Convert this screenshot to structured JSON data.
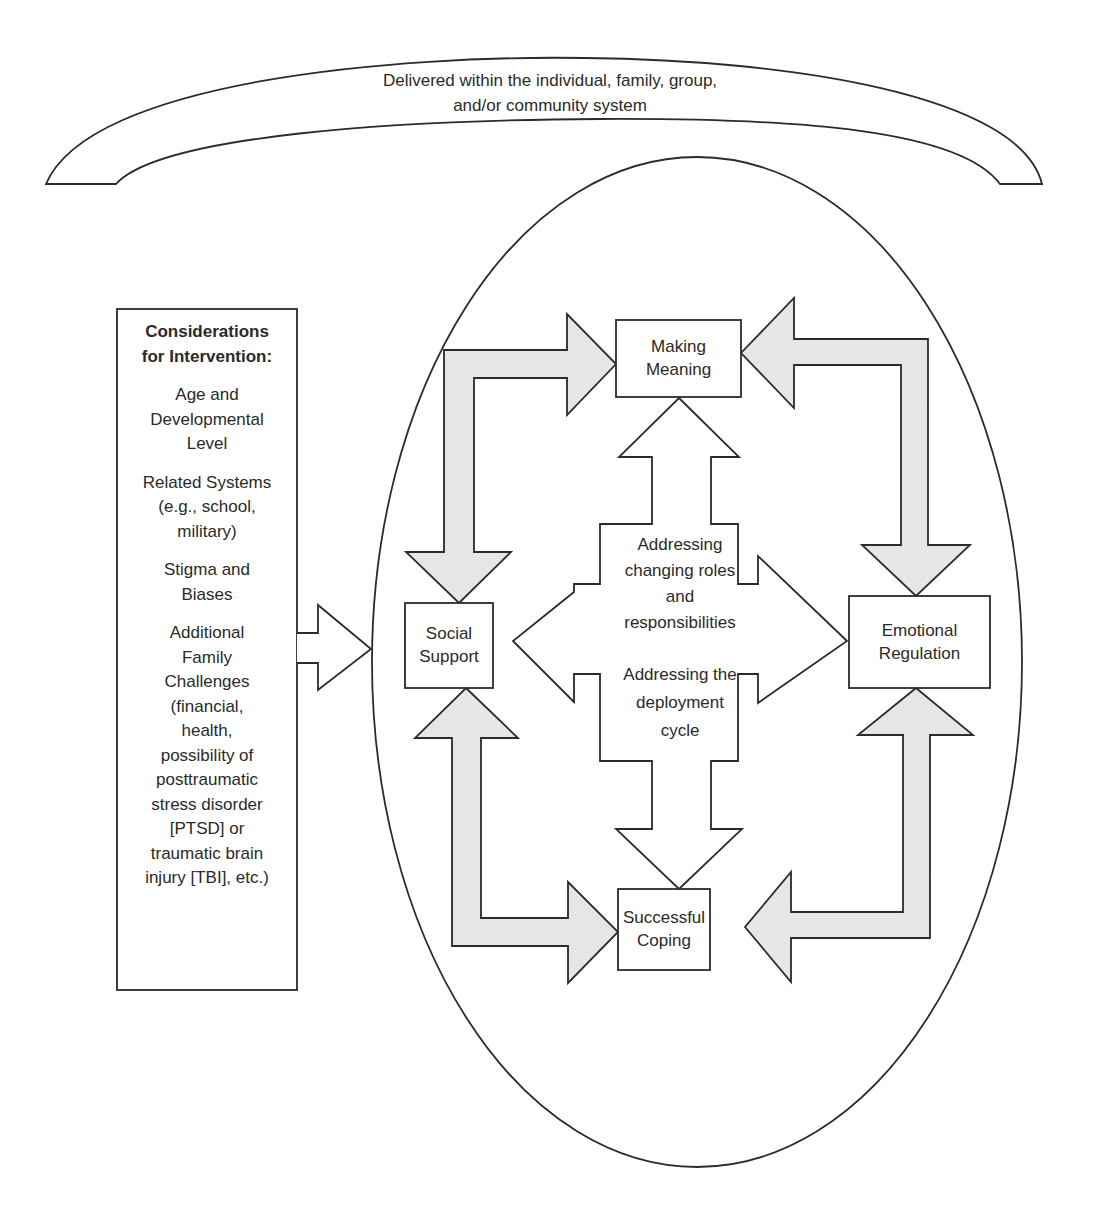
{
  "arc": {
    "lines": [
      "Delivered within the individual, family, group,",
      "and/or community system"
    ]
  },
  "considerations": {
    "title_lines": [
      "Considerations",
      "for Intervention:"
    ],
    "items": [
      {
        "lines": [
          "Age and",
          "Developmental",
          "Level"
        ]
      },
      {
        "lines": [
          "Related Systems",
          "(e.g., school,",
          "military)"
        ]
      },
      {
        "lines": [
          "Stigma and",
          "Biases"
        ]
      },
      {
        "lines": [
          "Additional",
          "Family",
          "Challenges",
          "(financial,",
          "health,",
          "possibility of",
          "posttraumatic",
          "stress disorder",
          "[PTSD] or",
          "traumatic brain",
          "injury [TBI], etc.)"
        ]
      }
    ]
  },
  "nodes": {
    "making_meaning": {
      "lines": [
        "Making",
        "Meaning"
      ]
    },
    "social_support": {
      "lines": [
        "Social",
        "Support"
      ]
    },
    "emotional_regulation": {
      "lines": [
        "Emotional",
        "Regulation"
      ]
    },
    "successful_coping": {
      "lines": [
        "Successful",
        "Coping"
      ]
    }
  },
  "center": {
    "top_lines": [
      "Addressing",
      "changing roles",
      "and",
      "responsibilities"
    ],
    "bottom_lines": [
      "Addressing the",
      "deployment",
      "cycle"
    ]
  },
  "colors": {
    "stroke": "#2b2b2b",
    "arrow_fill": "#e6e6e6",
    "background": "#ffffff"
  }
}
